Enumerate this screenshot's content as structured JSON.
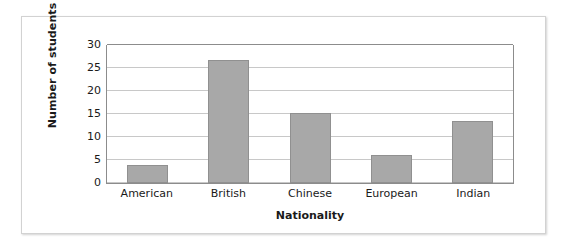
{
  "chart_data": {
    "type": "bar",
    "title": "",
    "subtitle": "",
    "xlabel": "Nationality",
    "ylabel": "Number of students",
    "categories": [
      "American",
      "British",
      "Chinese",
      "European",
      "Indian"
    ],
    "values": [
      4,
      26.7,
      15.3,
      6,
      13.4
    ],
    "series": [
      {
        "name": "Number of students",
        "values": [
          4,
          26.7,
          15.3,
          6,
          13.4
        ]
      }
    ],
    "ylim": [
      0,
      30
    ],
    "yticks": [
      0,
      5,
      10,
      15,
      20,
      25,
      30
    ],
    "ytick_labels": [
      "0",
      "5",
      "10",
      "15",
      "20",
      "25",
      "30"
    ],
    "grid": "horizontal",
    "legend": "none",
    "annotations": [],
    "colors": {
      "bar_fill": "#a8a8a8",
      "bar_stroke": "#909090",
      "gridline": "#c8c8c8",
      "axis": "#8c8c8c",
      "text": "#1a1a1a",
      "frame": "#d2d2d2",
      "background": "#ffffff"
    }
  }
}
